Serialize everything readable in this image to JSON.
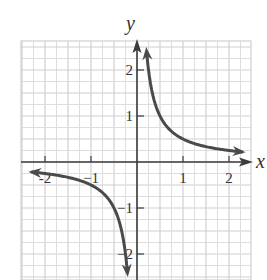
{
  "chart_data": {
    "type": "line",
    "title": "",
    "xlabel": "x",
    "ylabel": "y",
    "function": "y = 1/(2x)",
    "xlim": [
      -2.5,
      2.5
    ],
    "ylim": [
      -2.5,
      2.5
    ],
    "grid": true,
    "grid_step": 0.25,
    "x_ticks": [
      -2,
      -1,
      1,
      2
    ],
    "x_tick_labels": [
      "-2",
      "−1",
      "1",
      "2"
    ],
    "y_ticks": [
      -2,
      -1,
      1,
      2
    ],
    "y_tick_labels": [
      "−2",
      "−1",
      "1",
      "2"
    ],
    "series": [
      {
        "name": "branch-positive",
        "x": [
          0.2,
          0.25,
          0.3,
          0.4,
          0.5,
          0.75,
          1,
          1.5,
          2,
          2.35
        ],
        "y": [
          2.5,
          2.0,
          1.667,
          1.25,
          1.0,
          0.667,
          0.5,
          0.333,
          0.25,
          0.213
        ]
      },
      {
        "name": "branch-negative",
        "x": [
          -2.35,
          -2,
          -1.5,
          -1,
          -0.75,
          -0.5,
          -0.4,
          -0.3,
          -0.25,
          -0.2
        ],
        "y": [
          -0.213,
          -0.25,
          -0.333,
          -0.5,
          -0.667,
          -1.0,
          -1.25,
          -1.667,
          -2.0,
          -2.5
        ]
      }
    ]
  }
}
